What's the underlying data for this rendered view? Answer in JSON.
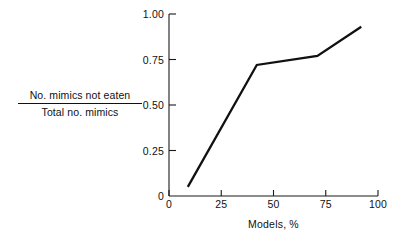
{
  "chart_data": {
    "type": "line",
    "title": "",
    "subtitle": "",
    "xlabel": "Models, %",
    "ylabel_numerator": "No. mimics not eaten",
    "ylabel_denominator": "Total no. mimics",
    "ylabel": "No. mimics not eaten / Total no. mimics",
    "xlim": [
      0,
      100
    ],
    "ylim": [
      0,
      1.0
    ],
    "xticks": [
      0,
      25,
      50,
      75,
      100
    ],
    "xtick_labels": [
      "0",
      "25",
      "50",
      "75",
      "100"
    ],
    "yticks": [
      0,
      0.25,
      0.5,
      0.75,
      1.0
    ],
    "ytick_labels": [
      "0",
      "0.25",
      "0.50",
      "0.75",
      "1.00"
    ],
    "grid": false,
    "legend": null,
    "series": [
      {
        "name": "proportion of mimics not eaten",
        "color": "#111111",
        "x": [
          9,
          42,
          71,
          92
        ],
        "values": [
          0.05,
          0.72,
          0.77,
          0.93
        ]
      }
    ],
    "annotations": []
  },
  "axes": {
    "x_axis_name": "models-percent-axis",
    "y_axis_name": "fraction-not-eaten-axis"
  }
}
